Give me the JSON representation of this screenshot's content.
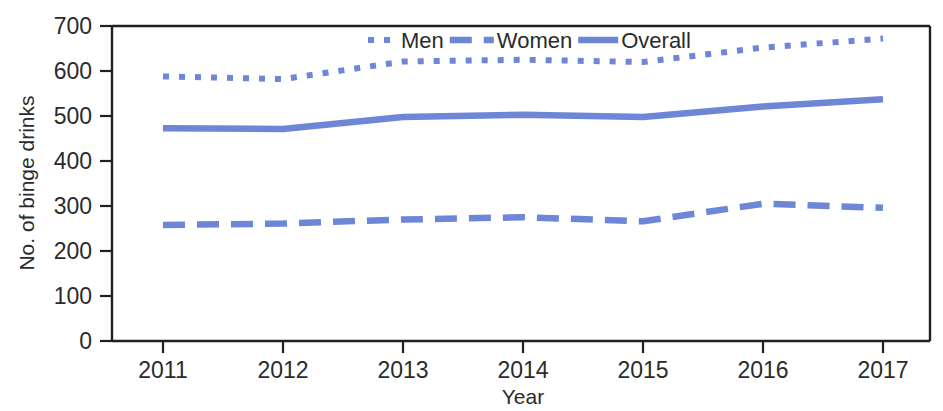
{
  "chart_data": {
    "type": "line",
    "title": "",
    "xlabel": "Year",
    "ylabel": "No. of binge drinks",
    "categories": [
      2011,
      2012,
      2013,
      2014,
      2015,
      2016,
      2017
    ],
    "x": [
      2011,
      2012,
      2013,
      2014,
      2015,
      2016,
      2017
    ],
    "xtick_labels": [
      "2011",
      "2012",
      "2013",
      "2014",
      "2015",
      "2016",
      "2017"
    ],
    "ytick_labels": [
      "0",
      "100",
      "200",
      "300",
      "400",
      "500",
      "600",
      "700"
    ],
    "yticks": [
      0,
      100,
      200,
      300,
      400,
      500,
      600,
      700
    ],
    "ylim": [
      0,
      700
    ],
    "xlim": [
      2011,
      2017
    ],
    "grid": false,
    "legend_position": "top-center",
    "series": [
      {
        "name": "Men",
        "style": "dotted",
        "color": "#6E86D6",
        "values": [
          588,
          582,
          621,
          625,
          620,
          652,
          672
        ]
      },
      {
        "name": "Women",
        "style": "dashed",
        "color": "#6E86D6",
        "values": [
          258,
          261,
          270,
          275,
          266,
          305,
          296
        ]
      },
      {
        "name": "Overall",
        "style": "solid",
        "color": "#6E86D6",
        "values": [
          473,
          471,
          498,
          503,
          498,
          521,
          537
        ]
      }
    ]
  },
  "legend": {
    "items": [
      {
        "label": "Men",
        "style": "dotted"
      },
      {
        "label": "Women",
        "style": "dashed"
      },
      {
        "label": "Overall",
        "style": "solid"
      }
    ]
  },
  "colors": {
    "series": "#6E86D6",
    "axis": "#231f20",
    "text": "#2b2b2b",
    "background": "#ffffff"
  }
}
